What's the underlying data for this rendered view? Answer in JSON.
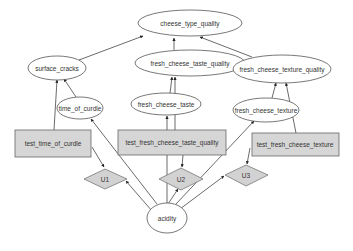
{
  "diagram": {
    "type": "influence-diagram",
    "colors": {
      "background": "#ffffff",
      "edge": "#444444",
      "ellipse_fill": "#ffffff",
      "ellipse_stroke": "#555555",
      "decision_fill": "#d6d6d6",
      "utility_fill": "#d2d2d2",
      "text": "#333333"
    },
    "nodes": {
      "cheese_type_quality": {
        "label": "cheese_type_quality",
        "shape": "ellipse"
      },
      "surface_cracks": {
        "label": "surface_cracks",
        "shape": "ellipse"
      },
      "fresh_cheese_taste_quality": {
        "label": "fresh_cheese_taste_quality",
        "shape": "ellipse"
      },
      "fresh_cheese_texture_quality": {
        "label": "fresh_cheese_texture_quality",
        "shape": "ellipse"
      },
      "time_of_curdle": {
        "label": "time_of_curdle",
        "shape": "ellipse"
      },
      "fresh_cheese_taste": {
        "label": "fresh_cheese_taste",
        "shape": "ellipse"
      },
      "fresh_cheese_texture": {
        "label": "fresh_cheese_texture",
        "shape": "ellipse"
      },
      "test_time_of_curdle": {
        "label": "test_time_of_curdle",
        "shape": "rectangle"
      },
      "test_fresh_cheese_taste_quality": {
        "label": "test_fresh_cheese_taste_quality",
        "shape": "rectangle"
      },
      "test_fresh_cheese_texture": {
        "label": "test_fresh_cheese_texture",
        "shape": "rectangle"
      },
      "U1": {
        "label": "U1",
        "shape": "diamond"
      },
      "U2": {
        "label": "U2",
        "shape": "diamond"
      },
      "U3": {
        "label": "U3",
        "shape": "diamond"
      },
      "acidity": {
        "label": "acidity",
        "shape": "ellipse"
      }
    },
    "edges": [
      {
        "from": "surface_cracks",
        "to": "cheese_type_quality"
      },
      {
        "from": "fresh_cheese_taste_quality",
        "to": "cheese_type_quality"
      },
      {
        "from": "fresh_cheese_texture_quality",
        "to": "cheese_type_quality"
      },
      {
        "from": "time_of_curdle",
        "to": "surface_cracks"
      },
      {
        "from": "test_time_of_curdle",
        "to": "surface_cracks"
      },
      {
        "from": "fresh_cheese_taste",
        "to": "fresh_cheese_taste_quality"
      },
      {
        "from": "test_fresh_cheese_taste_quality",
        "to": "fresh_cheese_taste_quality"
      },
      {
        "from": "fresh_cheese_texture",
        "to": "fresh_cheese_texture_quality"
      },
      {
        "from": "test_fresh_cheese_texture",
        "to": "fresh_cheese_texture_quality"
      },
      {
        "from": "test_fresh_cheese_taste_quality",
        "to": "fresh_cheese_taste"
      },
      {
        "from": "test_time_of_curdle",
        "to": "U1"
      },
      {
        "from": "test_fresh_cheese_taste_quality",
        "to": "U2"
      },
      {
        "from": "test_fresh_cheese_texture",
        "to": "U3"
      },
      {
        "from": "acidity",
        "to": "time_of_curdle"
      },
      {
        "from": "acidity",
        "to": "fresh_cheese_texture"
      },
      {
        "from": "acidity",
        "to": "U1"
      },
      {
        "from": "acidity",
        "to": "U2"
      },
      {
        "from": "acidity",
        "to": "U3"
      }
    ]
  }
}
